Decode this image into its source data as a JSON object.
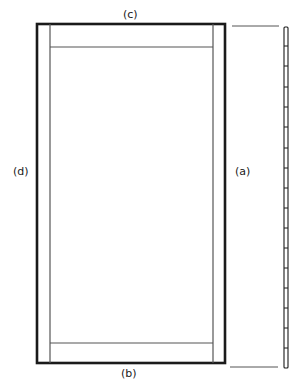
{
  "diagram": {
    "type": "door-frame-elevation",
    "labels": {
      "top": "(c)",
      "bottom": "(b)",
      "left": "(d)",
      "right": "(a)"
    },
    "colors": {
      "stroke": "#1a1a1a",
      "thin_stroke": "#555555",
      "background": "#ffffff"
    },
    "frame": {
      "outer": {
        "x": 37,
        "y": 24,
        "width": 188,
        "height": 339
      },
      "stile_left_inner_x": 50,
      "stile_right_inner_x": 213,
      "top_rail_y": 47,
      "bottom_rail_y": 343
    },
    "side_view": {
      "x": 284,
      "y": 27,
      "width": 4,
      "height": 341,
      "tick_ys": [
        46,
        66,
        87,
        107,
        127,
        148,
        168,
        188,
        208,
        228,
        248,
        268,
        288,
        308,
        328,
        348
      ]
    },
    "dimension_lines": [
      {
        "x1": 232,
        "y1": 26,
        "x2": 279,
        "y2": 26
      },
      {
        "x1": 230,
        "y1": 367,
        "x2": 278,
        "y2": 367
      }
    ]
  }
}
